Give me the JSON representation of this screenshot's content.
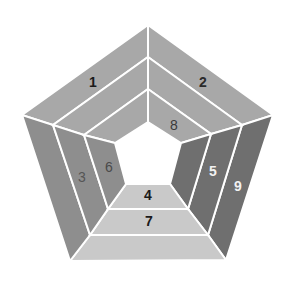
{
  "diagram": {
    "type": "nested-pentagon",
    "colors": {
      "top": "#a8a8a8",
      "left": "#8e8e8e",
      "right": "#6f6f6f",
      "bottom": "#c9c9c9",
      "divider": "#ffffff",
      "center": "#ffffff"
    },
    "labels": [
      {
        "id": "1",
        "text": "1",
        "x": 93,
        "y": 83,
        "color": "#1a1a1a"
      },
      {
        "id": "2",
        "text": "2",
        "x": 203,
        "y": 83,
        "color": "#2a2a2a"
      },
      {
        "id": "3",
        "text": "3",
        "x": 82,
        "y": 178,
        "color": "#555555"
      },
      {
        "id": "4",
        "text": "4",
        "x": 148,
        "y": 196,
        "color": "#1a1a1a"
      },
      {
        "id": "5",
        "text": "5",
        "x": 213,
        "y": 172,
        "color": "#f2f2f2"
      },
      {
        "id": "6",
        "text": "6",
        "x": 109,
        "y": 168,
        "color": "#4a4a4a"
      },
      {
        "id": "7",
        "text": "7",
        "x": 149,
        "y": 222,
        "color": "#1a1a1a"
      },
      {
        "id": "8",
        "text": "8",
        "x": 174,
        "y": 126,
        "color": "#3a3a3a"
      },
      {
        "id": "9",
        "text": "9",
        "x": 238,
        "y": 187,
        "color": "#f2f2f2"
      }
    ]
  }
}
